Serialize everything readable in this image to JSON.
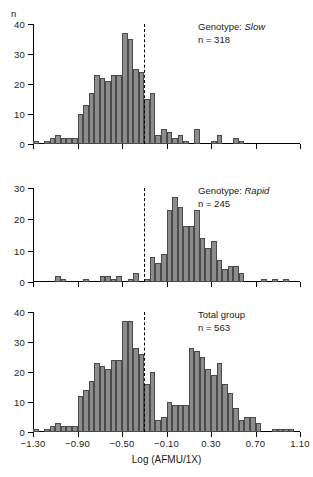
{
  "figure": {
    "y_axis_name": "n",
    "x_axis_title": "Log (AFMU/1X)"
  },
  "chart_data": {
    "type": "bar",
    "title": "",
    "xlabel": "Log (AFMU/1X)",
    "ylabel": "n",
    "xlim": [
      -1.3,
      1.1
    ],
    "xticks": [
      "−1.30",
      "−0.90",
      "−0.50",
      "−0.10",
      "0.30",
      "0.70",
      "1.10"
    ],
    "xtick_values": [
      -1.3,
      -0.9,
      -0.5,
      -0.1,
      0.3,
      0.7,
      1.1
    ],
    "bin_width": 0.05,
    "grid": false,
    "legend": "none",
    "cutoff_line": -0.3,
    "panels": [
      {
        "id": "slow",
        "annotation_line1_prefix": "Genotype: ",
        "annotation_line1_value": "Slow",
        "annotation_line2": "n = 318",
        "ylim": [
          0,
          40
        ],
        "yticks": [
          0,
          10,
          20,
          30,
          40
        ],
        "bin_starts": [
          -1.3,
          -1.25,
          -1.2,
          -1.15,
          -1.1,
          -1.05,
          -1.0,
          -0.95,
          -0.9,
          -0.85,
          -0.8,
          -0.75,
          -0.7,
          -0.65,
          -0.6,
          -0.55,
          -0.5,
          -0.45,
          -0.4,
          -0.35,
          -0.3,
          -0.25,
          -0.2,
          -0.15,
          -0.1,
          -0.05,
          0.0,
          0.05,
          0.1,
          0.15,
          0.2,
          0.25,
          0.3,
          0.35,
          0.4,
          0.45,
          0.5,
          0.55,
          0.6,
          0.65,
          0.7,
          0.75,
          0.8,
          0.85,
          0.9,
          0.95,
          1.0,
          1.05
        ],
        "values": [
          1,
          0,
          1,
          2,
          3,
          2,
          2,
          2,
          10,
          13,
          17,
          23,
          22,
          21,
          23,
          23,
          37,
          35,
          25,
          24,
          15,
          17,
          3,
          5,
          4,
          2,
          3,
          1,
          0,
          5,
          0,
          0,
          1,
          3,
          0,
          0,
          2,
          1,
          0,
          0,
          0,
          0,
          0,
          0,
          0,
          0,
          0,
          0
        ]
      },
      {
        "id": "rapid",
        "annotation_line1_prefix": "Genotype: ",
        "annotation_line1_value": "Rapid",
        "annotation_line2": "n = 245",
        "ylim": [
          0,
          30
        ],
        "yticks": [
          0,
          10,
          20,
          30
        ],
        "bin_starts": [
          -1.3,
          -1.25,
          -1.2,
          -1.15,
          -1.1,
          -1.05,
          -1.0,
          -0.95,
          -0.9,
          -0.85,
          -0.8,
          -0.75,
          -0.7,
          -0.65,
          -0.6,
          -0.55,
          -0.5,
          -0.45,
          -0.4,
          -0.35,
          -0.3,
          -0.25,
          -0.2,
          -0.15,
          -0.1,
          -0.05,
          0.0,
          0.05,
          0.1,
          0.15,
          0.2,
          0.25,
          0.3,
          0.35,
          0.4,
          0.45,
          0.5,
          0.55,
          0.6,
          0.65,
          0.7,
          0.75,
          0.8,
          0.85,
          0.9,
          0.95,
          1.0,
          1.05
        ],
        "values": [
          0,
          0,
          0,
          0,
          2,
          1,
          0,
          0,
          0,
          1,
          0,
          0,
          2,
          2,
          1,
          2,
          0,
          1,
          3,
          0,
          1,
          8,
          6,
          9,
          23,
          27,
          24,
          18,
          18,
          23,
          14,
          11,
          13,
          7,
          4,
          5,
          5,
          3,
          0,
          0,
          0,
          1,
          0,
          1,
          0,
          1,
          0,
          0
        ]
      },
      {
        "id": "total",
        "annotation_line1_prefix": "Total group",
        "annotation_line1_value": "",
        "annotation_line2": "n = 563",
        "ylim": [
          0,
          40
        ],
        "yticks": [
          0,
          10,
          20,
          30,
          40
        ],
        "bin_starts": [
          -1.3,
          -1.25,
          -1.2,
          -1.15,
          -1.1,
          -1.05,
          -1.0,
          -0.95,
          -0.9,
          -0.85,
          -0.8,
          -0.75,
          -0.7,
          -0.65,
          -0.6,
          -0.55,
          -0.5,
          -0.45,
          -0.4,
          -0.35,
          -0.3,
          -0.25,
          -0.2,
          -0.15,
          -0.1,
          -0.05,
          0.0,
          0.05,
          0.1,
          0.15,
          0.2,
          0.25,
          0.3,
          0.35,
          0.4,
          0.45,
          0.5,
          0.55,
          0.6,
          0.65,
          0.7,
          0.75,
          0.8,
          0.85,
          0.9,
          0.95,
          1.0,
          1.05
        ],
        "values": [
          1,
          0,
          1,
          2,
          3,
          2,
          2,
          2,
          12,
          14,
          17,
          23,
          22,
          21,
          24,
          24,
          37,
          37,
          28,
          26,
          16,
          20,
          4,
          5,
          10,
          9,
          9,
          9,
          28,
          27,
          25,
          21,
          19,
          23,
          16,
          13,
          8,
          4,
          5,
          5,
          3,
          0,
          0,
          1,
          1,
          1,
          1,
          0
        ]
      }
    ]
  }
}
